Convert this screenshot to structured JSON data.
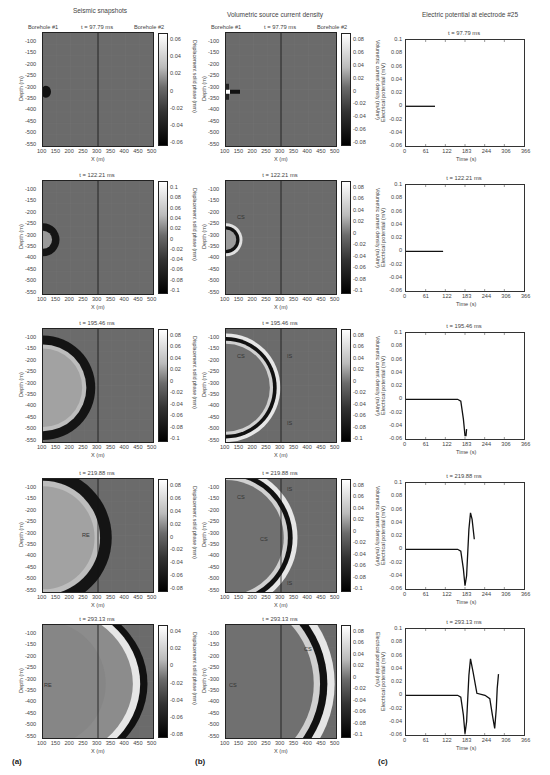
{
  "columns": {
    "a": {
      "title": "Seismic snapshots",
      "label": "(a)"
    },
    "b": {
      "title": "Volumetric source current density",
      "label": "(b)"
    },
    "c": {
      "title": "Electric potential at electrode #25",
      "label": "(c)"
    }
  },
  "boreholes": {
    "left": "Borehole #1",
    "right": "Borehole #2"
  },
  "axes": {
    "map_x_label": "X (m)",
    "map_y_label": "Depth (m)",
    "map_x_ticks": [
      "100",
      "150",
      "200",
      "250",
      "300",
      "350",
      "400",
      "450",
      "500"
    ],
    "map_y_ticks": [
      "-100",
      "-150",
      "-200",
      "-250",
      "-300",
      "-350",
      "-400",
      "-450",
      "-500",
      "-550"
    ],
    "cbar_a_label": "Displacement solid phase (mm)",
    "cbar_b_label": "Volumetric current density (mA/m³)",
    "cbar_b_label_last": "Electrical potential (mV)",
    "plot_x_label": "Time (s)",
    "plot_y_label": "Electrical potential (mV)",
    "plot_x_ticks": [
      "0",
      "61",
      "122",
      "183",
      "244",
      "306",
      "366"
    ],
    "plot_y_ticks": [
      "0.1",
      "0.08",
      "0.06",
      "0.04",
      "0.02",
      "0",
      "-0.02",
      "-0.04",
      "-0.06"
    ]
  },
  "rows": [
    {
      "time": "t = 97.79 ms",
      "cbar_a": [
        "0.06",
        "0.04",
        "0.02",
        "0",
        "-0.02",
        "-0.04",
        "-0.06"
      ],
      "cbar_b": [
        "0.08",
        "0.06",
        "0.04",
        "0.02",
        "0",
        "-0.02",
        "-0.04",
        "-0.06",
        "-0.08"
      ],
      "annotations_a": [],
      "annotations_b": []
    },
    {
      "time": "t = 122.21 ms",
      "cbar_a": [
        "0.1",
        "0.08",
        "0.06",
        "0.04",
        "0.02",
        "0",
        "-0.02",
        "-0.04",
        "-0.06",
        "-0.08",
        "-0.1"
      ],
      "cbar_b": [
        "0.08",
        "0.06",
        "0.04",
        "0.02",
        "0",
        "-0.02",
        "-0.04",
        "-0.06",
        "-0.08",
        "-0.1"
      ],
      "annotations_a": [],
      "annotations_b": [
        "CS"
      ]
    },
    {
      "time": "t = 195.46 ms",
      "cbar_a": [
        "0.08",
        "0.06",
        "0.04",
        "0.02",
        "0",
        "-0.02",
        "-0.04",
        "-0.06",
        "-0.08",
        "-0.1"
      ],
      "cbar_b": [
        "0.08",
        "0.06",
        "0.04",
        "0.02",
        "0",
        "-0.02",
        "-0.04",
        "-0.06",
        "-0.08",
        "-0.1"
      ],
      "annotations_a": [],
      "annotations_b": [
        "CS",
        "IS",
        "IS"
      ]
    },
    {
      "time": "t = 219.88 ms",
      "cbar_a": [
        "0.08",
        "0.06",
        "0.04",
        "0.02",
        "0",
        "-0.02",
        "-0.04",
        "-0.06",
        "-0.08"
      ],
      "cbar_b": [
        "0.08",
        "0.06",
        "0.04",
        "0.02",
        "0",
        "-0.02",
        "-0.04",
        "-0.06",
        "-0.08",
        "-0.1"
      ],
      "annotations_a": [
        "RE"
      ],
      "annotations_b": [
        "CS",
        "CS",
        "IS",
        "IS"
      ]
    },
    {
      "time": "t = 293.13 ms",
      "cbar_a": [
        "0.04",
        "0.02",
        "0",
        "-0.02",
        "-0.04",
        "-0.06",
        "-0.08"
      ],
      "cbar_b": [
        "0.08",
        "0.06",
        "0.04",
        "0.02",
        "0",
        "-0.02",
        "-0.04",
        "-0.06",
        "-0.08",
        "-0.1"
      ],
      "annotations_a": [
        "RE"
      ],
      "annotations_b": [
        "CS",
        "CS"
      ]
    }
  ],
  "chart_data": [
    {
      "type": "heatmap",
      "title": "Seismic snapshots",
      "xlabel": "X (m)",
      "ylabel": "Depth (m)",
      "xlim": [
        100,
        500
      ],
      "ylim": [
        -550,
        -50
      ],
      "colorbar_label": "Displacement solid phase (mm)",
      "snapshots": [
        "97.79 ms",
        "122.21 ms",
        "195.46 ms",
        "219.88 ms",
        "293.13 ms"
      ],
      "colorbar_ranges": [
        [
          -0.06,
          0.06
        ],
        [
          -0.1,
          0.1
        ],
        [
          -0.1,
          0.08
        ],
        [
          -0.08,
          0.08
        ],
        [
          -0.08,
          0.04
        ]
      ],
      "wavefront_radius_m": [
        15,
        60,
        190,
        250,
        380
      ],
      "source": {
        "x": 100,
        "depth": -310
      },
      "annotations": {
        "219.88 ms": [
          "RE"
        ],
        "293.13 ms": [
          "RE"
        ]
      }
    },
    {
      "type": "heatmap",
      "title": "Volumetric source current density",
      "xlabel": "X (m)",
      "ylabel": "Depth (m)",
      "xlim": [
        100,
        500
      ],
      "ylim": [
        -550,
        -50
      ],
      "colorbar_label": "Volumetric current density (mA/m^3)",
      "snapshots": [
        "97.79 ms",
        "122.21 ms",
        "195.46 ms",
        "219.88 ms",
        "293.13 ms"
      ],
      "colorbar_ranges": [
        [
          -0.08,
          0.08
        ],
        [
          -0.1,
          0.08
        ],
        [
          -0.1,
          0.08
        ],
        [
          -0.1,
          0.08
        ],
        [
          -0.1,
          0.08
        ]
      ],
      "interface_x_m": 300,
      "annotations": {
        "122.21 ms": [
          "CS"
        ],
        "195.46 ms": [
          "CS",
          "IS",
          "IS"
        ],
        "219.88 ms": [
          "CS",
          "CS",
          "IS",
          "IS"
        ],
        "293.13 ms": [
          "CS",
          "CS"
        ]
      }
    },
    {
      "type": "line",
      "title": "Electric potential at electrode #25",
      "xlabel": "Time (s)",
      "ylabel": "Electrical potential (mV)",
      "xlim": [
        0,
        366
      ],
      "ylim": [
        -0.06,
        0.1
      ],
      "x_ticks": [
        0,
        61,
        122,
        183,
        244,
        306,
        366
      ],
      "y_ticks": [
        -0.06,
        -0.04,
        -0.02,
        0,
        0.02,
        0.04,
        0.06,
        0.08,
        0.1
      ],
      "series": [
        {
          "name": "t = 97.79 ms",
          "x": [
            0,
            90
          ],
          "y": [
            0,
            0
          ]
        },
        {
          "name": "t = 122.21 ms",
          "x": [
            0,
            115
          ],
          "y": [
            0,
            0
          ]
        },
        {
          "name": "t = 195.46 ms",
          "x": [
            0,
            160,
            170,
            178,
            183,
            186,
            188
          ],
          "y": [
            0,
            0,
            -0.003,
            -0.03,
            -0.055,
            -0.055,
            -0.045
          ]
        },
        {
          "name": "t = 219.88 ms",
          "x": [
            0,
            160,
            170,
            178,
            183,
            188,
            195,
            200,
            205,
            212
          ],
          "y": [
            0,
            0,
            -0.003,
            -0.03,
            -0.055,
            -0.04,
            0.03,
            0.055,
            0.045,
            0.015
          ]
        },
        {
          "name": "t = 293.13 ms",
          "x": [
            0,
            160,
            170,
            178,
            183,
            188,
            195,
            200,
            208,
            220,
            245,
            260,
            268,
            275,
            280,
            283,
            287
          ],
          "y": [
            0,
            0,
            -0.003,
            -0.03,
            -0.058,
            -0.04,
            0.03,
            0.055,
            0.035,
            0.003,
            0,
            -0.005,
            -0.03,
            -0.05,
            -0.02,
            0.01,
            0.032
          ]
        }
      ]
    }
  ]
}
